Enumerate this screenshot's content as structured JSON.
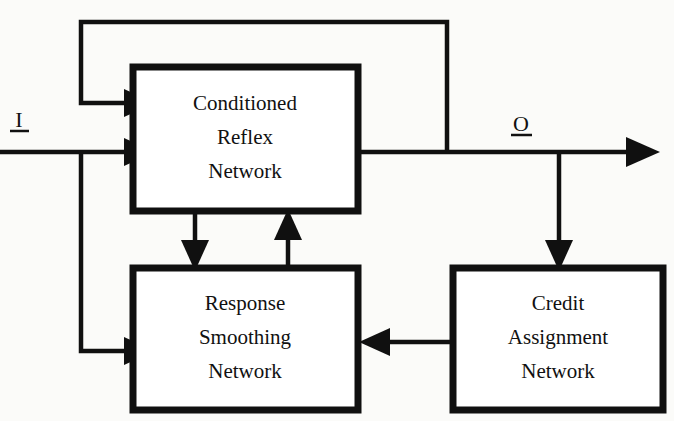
{
  "diagram": {
    "background_color": "#fbfbf9",
    "line_color": "#101010",
    "box_fill": "#ffffff",
    "boxes": [
      {
        "id": "conditioned-reflex-network",
        "lines": [
          "Conditioned",
          "Reflex",
          "Network"
        ],
        "x": 133,
        "y": 67,
        "width": 225,
        "height": 144
      },
      {
        "id": "response-smoothing-network",
        "lines": [
          "Response",
          "Smoothing",
          "Network"
        ],
        "x": 133,
        "y": 268,
        "width": 225,
        "height": 142
      },
      {
        "id": "credit-assignment-network",
        "lines": [
          "Credit",
          "Assignment",
          "Network"
        ],
        "x": 453,
        "y": 268,
        "width": 210,
        "height": 142
      }
    ],
    "io_labels": [
      {
        "id": "input-label",
        "text": "I",
        "x": 19,
        "y": 127,
        "underline_width": 19
      },
      {
        "id": "output-label",
        "text": "O",
        "x": 521,
        "y": 131,
        "underline_width": 21
      }
    ],
    "connections": [
      {
        "id": "input-to-crn",
        "from": "input",
        "to": "conditioned-reflex-network"
      },
      {
        "id": "input-branch-to-rsn",
        "from": "input",
        "to": "response-smoothing-network"
      },
      {
        "id": "output-feedback-to-crn",
        "from": "output",
        "to": "conditioned-reflex-network"
      },
      {
        "id": "crn-to-output",
        "from": "conditioned-reflex-network",
        "to": "output"
      },
      {
        "id": "crn-to-rsn",
        "from": "conditioned-reflex-network",
        "to": "response-smoothing-network"
      },
      {
        "id": "rsn-to-crn",
        "from": "response-smoothing-network",
        "to": "conditioned-reflex-network"
      },
      {
        "id": "output-branch-to-can",
        "from": "output",
        "to": "credit-assignment-network"
      },
      {
        "id": "can-to-rsn",
        "from": "credit-assignment-network",
        "to": "response-smoothing-network"
      }
    ]
  }
}
